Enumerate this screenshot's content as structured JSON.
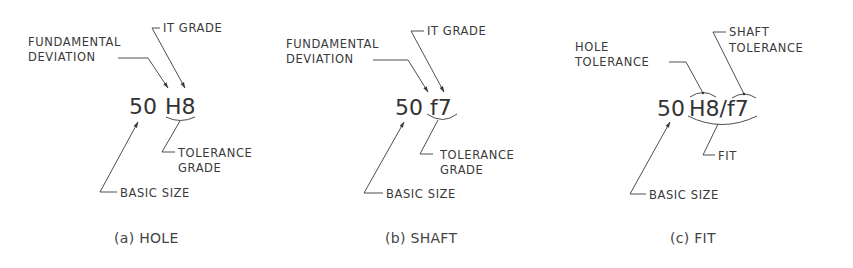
{
  "panels": [
    {
      "id": "a",
      "designation": {
        "size": "50",
        "tolerance": "H8"
      },
      "labels": {
        "fundamental_deviation_1": "FUNDAMENTAL",
        "fundamental_deviation_2": "DEVIATION",
        "it_grade": "IT GRADE",
        "tolerance_grade_1": "TOLERANCE",
        "tolerance_grade_2": "GRADE",
        "basic_size": "BASIC SIZE"
      },
      "caption": "(a) HOLE"
    },
    {
      "id": "b",
      "designation": {
        "size": "50",
        "tolerance": "f7"
      },
      "labels": {
        "fundamental_deviation_1": "FUNDAMENTAL",
        "fundamental_deviation_2": "DEVIATION",
        "it_grade": "IT GRADE",
        "tolerance_grade_1": "TOLERANCE",
        "tolerance_grade_2": "GRADE",
        "basic_size": "BASIC SIZE"
      },
      "caption": "(b) SHAFT"
    },
    {
      "id": "c",
      "designation": {
        "size": "50",
        "tolerance": "H8/f7"
      },
      "labels": {
        "hole_tolerance_1": "HOLE",
        "hole_tolerance_2": "TOLERANCE",
        "shaft_tolerance_1": "SHAFT",
        "shaft_tolerance_2": "TOLERANCE",
        "fit": "FIT",
        "basic_size": "BASIC SIZE"
      },
      "caption": "(c) FIT"
    }
  ]
}
